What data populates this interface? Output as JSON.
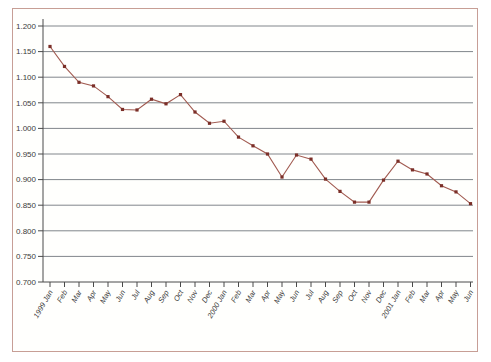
{
  "colors": {
    "frame_border": "#c79e96",
    "plot_background": "#fffffd",
    "gridline": "#81868b",
    "axis": "#4a4a4a",
    "series_line": "#a15a50",
    "series_marker": "#7b2f28",
    "tick_label": "#3b3b3b"
  },
  "chart_data": {
    "type": "line",
    "title": "",
    "xlabel": "",
    "ylabel": "",
    "legend": "none",
    "grid": "horizontal",
    "marker": "square",
    "ylim": [
      0.7,
      1.2
    ],
    "ytick_step": 0.05,
    "ytick_labels": [
      "1.200",
      "1.150",
      "1.100",
      "1.050",
      "1.000",
      "0.950",
      "0.900",
      "0.850",
      "0.800",
      "0.750",
      "0.700"
    ],
    "categories": [
      "1999 Jan",
      "Feb",
      "Mar",
      "Apr",
      "May",
      "Jun",
      "Jul",
      "Aug",
      "Sep",
      "Oct",
      "Nov",
      "Dec",
      "2000 Jan",
      "Feb",
      "Mar",
      "Apr",
      "May",
      "Jun",
      "Jul",
      "Aug",
      "Sep",
      "Oct",
      "Nov",
      "Dec",
      "2001 Jan",
      "Feb",
      "Mar",
      "Apr",
      "May",
      "Jun"
    ],
    "series": [
      {
        "name": "monthly-rate-series",
        "values": [
          1.16,
          1.121,
          1.09,
          1.083,
          1.062,
          1.037,
          1.036,
          1.057,
          1.048,
          1.066,
          1.032,
          1.01,
          1.014,
          0.983,
          0.966,
          0.95,
          0.905,
          0.948,
          0.94,
          0.901,
          0.877,
          0.856,
          0.856,
          0.899,
          0.936,
          0.919,
          0.911,
          0.888,
          0.876,
          0.853
        ]
      }
    ]
  }
}
